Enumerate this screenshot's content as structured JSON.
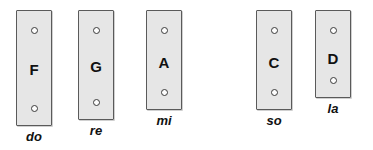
{
  "diagram": {
    "background_color": "#ffffff",
    "bar_fill_color": "#e6e6e6",
    "bar_border_color": "#5a5a5a",
    "hole_border_color": "#3a3a3a",
    "text_color": "#111111",
    "bars": [
      {
        "note": "F",
        "solfege": "do",
        "x": 16,
        "y": 10,
        "width": 36,
        "height": 116,
        "hole_top_y": 16,
        "hole_bottom_y": 94,
        "letter_y": 51,
        "label_y": 130
      },
      {
        "note": "G",
        "solfege": "re",
        "x": 78,
        "y": 10,
        "width": 36,
        "height": 110,
        "hole_top_y": 16,
        "hole_bottom_y": 88,
        "letter_y": 48,
        "label_y": 124
      },
      {
        "note": "A",
        "solfege": "mi",
        "x": 146,
        "y": 10,
        "width": 36,
        "height": 100,
        "hole_top_y": 16,
        "hole_bottom_y": 78,
        "letter_y": 44,
        "label_y": 114
      },
      {
        "note": "C",
        "solfege": "so",
        "x": 256,
        "y": 10,
        "width": 36,
        "height": 100,
        "hole_top_y": 16,
        "hole_bottom_y": 78,
        "letter_y": 44,
        "label_y": 114
      },
      {
        "note": "D",
        "solfege": "la",
        "x": 315,
        "y": 10,
        "width": 36,
        "height": 88,
        "hole_top_y": 16,
        "hole_bottom_y": 66,
        "letter_y": 40,
        "label_y": 102
      }
    ]
  }
}
